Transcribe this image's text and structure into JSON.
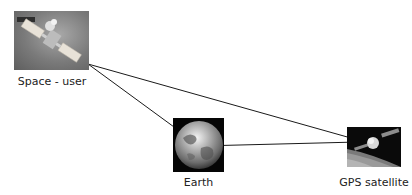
{
  "nodes": [
    {
      "id": "space-user",
      "label": "Space - user",
      "icon": "satellite-in-space-photo"
    },
    {
      "id": "earth",
      "label": "Earth",
      "icon": "earth-globe-photo"
    },
    {
      "id": "gps-satellite",
      "label": "GPS satellite",
      "icon": "gps-satellite-photo"
    }
  ],
  "edges": [
    {
      "from": "space-user",
      "to": "earth"
    },
    {
      "from": "space-user",
      "to": "gps-satellite"
    },
    {
      "from": "earth",
      "to": "gps-satellite"
    }
  ],
  "colors": {
    "line": "#1a1a1a",
    "background": "#ffffff"
  }
}
